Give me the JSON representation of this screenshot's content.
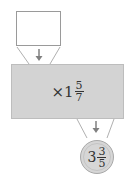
{
  "diagram": {
    "type": "function-machine",
    "input": {
      "value": ""
    },
    "operation": {
      "symbol": "×",
      "whole": "1",
      "numerator": "5",
      "denominator": "7"
    },
    "output": {
      "whole": "3",
      "numerator": "3",
      "denominator": "5"
    },
    "colors": {
      "machine_fill": "#d3d3d3",
      "circle_fill": "#d6d6d6",
      "line": "#9a9a9a",
      "text": "#333333"
    }
  }
}
